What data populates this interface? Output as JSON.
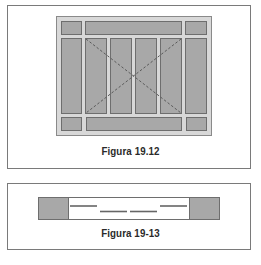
{
  "figures": [
    {
      "caption": "Figura 19.12",
      "description": "Window elevation with fixed side/top/bottom lites and four central sliding panels; dashed X marks opening",
      "colors": {
        "pane": "#a8a8a8",
        "frame": "#d8d8d8",
        "outline": "#6e6e6e",
        "dash": "#6a6a6a"
      }
    },
    {
      "caption": "Figura 19-13",
      "description": "Plan section of sliding panels between two fixed jambs",
      "colors": {
        "jamb": "#a8a8a8",
        "track": "#666666"
      }
    }
  ]
}
